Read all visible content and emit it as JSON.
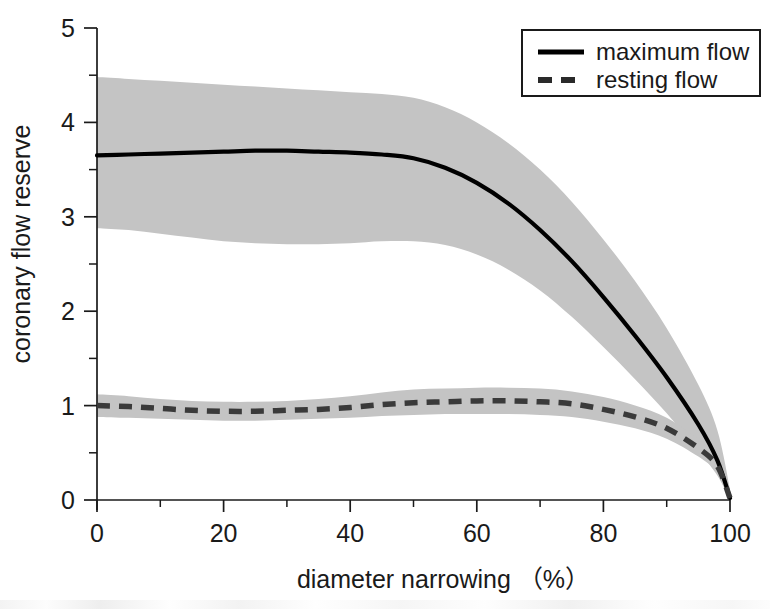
{
  "chart_data": {
    "type": "line",
    "title": "",
    "xlabel": "diameter narrowing （%）",
    "ylabel": "coronary flow reserve",
    "xlim": [
      0,
      100
    ],
    "ylim": [
      0,
      5
    ],
    "grid": false,
    "x_ticks_major": [
      0,
      20,
      40,
      60,
      80,
      100
    ],
    "x_tick_labels": [
      "0",
      "20",
      "40",
      "60",
      "80",
      "100"
    ],
    "x_ticks_minor": [
      10,
      30,
      50,
      70,
      90
    ],
    "y_ticks_major": [
      0,
      1,
      2,
      3,
      4,
      5
    ],
    "y_tick_labels": [
      "0",
      "1",
      "2",
      "3",
      "4",
      "5"
    ],
    "y_ticks_minor": [
      0.5,
      1.5,
      2.5,
      3.5,
      4.5
    ],
    "legend_position": "top-right",
    "band_color": "#c4c4c4",
    "line_color": "#000000",
    "x": [
      0,
      5,
      10,
      15,
      20,
      25,
      30,
      35,
      40,
      45,
      50,
      55,
      60,
      65,
      70,
      75,
      80,
      85,
      90,
      95,
      98,
      100
    ],
    "series": [
      {
        "name": "maximum flow",
        "style": "solid",
        "color": "#000000",
        "values": [
          3.65,
          3.66,
          3.67,
          3.68,
          3.69,
          3.7,
          3.7,
          3.69,
          3.68,
          3.66,
          3.62,
          3.52,
          3.36,
          3.14,
          2.86,
          2.53,
          2.15,
          1.74,
          1.3,
          0.8,
          0.42,
          0.02
        ],
        "band_upper": [
          4.48,
          4.46,
          4.44,
          4.42,
          4.4,
          4.38,
          4.36,
          4.34,
          4.32,
          4.3,
          4.26,
          4.16,
          4.0,
          3.78,
          3.5,
          3.16,
          2.76,
          2.32,
          1.82,
          1.22,
          0.74,
          0.12
        ],
        "band_lower": [
          2.88,
          2.86,
          2.82,
          2.78,
          2.74,
          2.72,
          2.71,
          2.71,
          2.72,
          2.74,
          2.74,
          2.7,
          2.6,
          2.44,
          2.22,
          1.94,
          1.62,
          1.28,
          0.92,
          0.52,
          0.26,
          0.0
        ]
      },
      {
        "name": "resting flow",
        "style": "dashed",
        "color": "#3a3a3a",
        "values": [
          1.0,
          0.99,
          0.97,
          0.95,
          0.94,
          0.94,
          0.95,
          0.96,
          0.98,
          1.01,
          1.03,
          1.04,
          1.05,
          1.05,
          1.04,
          1.02,
          0.96,
          0.88,
          0.76,
          0.55,
          0.36,
          0.02
        ],
        "band_upper": [
          1.12,
          1.1,
          1.07,
          1.05,
          1.04,
          1.04,
          1.05,
          1.07,
          1.1,
          1.14,
          1.17,
          1.18,
          1.19,
          1.19,
          1.18,
          1.15,
          1.09,
          1.0,
          0.87,
          0.64,
          0.44,
          0.08
        ],
        "band_lower": [
          0.88,
          0.87,
          0.86,
          0.85,
          0.84,
          0.84,
          0.85,
          0.86,
          0.87,
          0.89,
          0.9,
          0.91,
          0.91,
          0.91,
          0.9,
          0.88,
          0.83,
          0.76,
          0.65,
          0.46,
          0.29,
          0.0
        ]
      }
    ],
    "legend": [
      {
        "label": "maximum flow",
        "style": "solid"
      },
      {
        "label": "resting flow",
        "style": "dashed"
      }
    ]
  }
}
